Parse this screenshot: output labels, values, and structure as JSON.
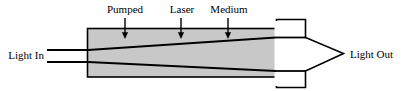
{
  "figure": {
    "name": "pumped-laser-medium-amplifier-diagram",
    "colors": {
      "medium_fill": "#c8c8c8",
      "stroke": "#000000",
      "arrow_fill": "#ffffff",
      "background": "#ffffff"
    },
    "callouts": [
      {
        "label": "Pumped",
        "x": 125
      },
      {
        "label": "Laser",
        "x": 182
      },
      {
        "label": "Medium",
        "x": 229
      }
    ],
    "input_label": "Light In",
    "output_label": "Light Out"
  }
}
